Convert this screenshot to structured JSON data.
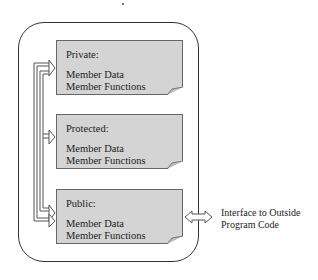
{
  "diagram": {
    "type": "class-access-structure",
    "sections": [
      {
        "title": "Private:",
        "lines": [
          "Member Data",
          "Member Functions"
        ]
      },
      {
        "title": "Protected:",
        "lines": [
          "Member Data",
          "Member Functions"
        ]
      },
      {
        "title": "Public:",
        "lines": [
          "Member Data",
          "Member Functions"
        ]
      }
    ],
    "interface_label": {
      "line1": "Interface to Outside",
      "line2": "Program Code"
    },
    "colors": {
      "section_fill": "#d4d4d4",
      "border": "#333333",
      "arrow_stroke": "#555555"
    }
  }
}
